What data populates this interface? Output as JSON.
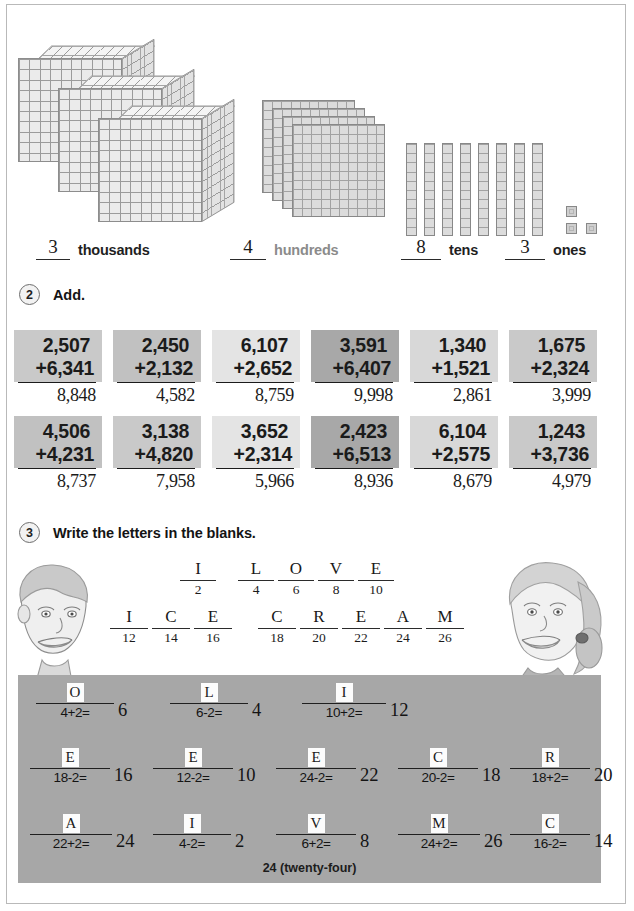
{
  "page": {
    "footer": "24 (twenty-four)",
    "accent_panel_color": "#a7a7a7"
  },
  "place_value": {
    "groups": [
      {
        "value": "3",
        "label": "thousands",
        "style": "dark"
      },
      {
        "value": "4",
        "label": "hundreds",
        "style": "light"
      },
      {
        "value": "8",
        "label": "tens",
        "style": "dark"
      },
      {
        "value": "3",
        "label": "ones",
        "style": "dark"
      }
    ],
    "manipulatives": {
      "thousands_cubes": 3,
      "hundreds_flats": 4,
      "tens_rods": 8,
      "ones_units": 3
    }
  },
  "sections": [
    {
      "number": "2",
      "title": "Add."
    },
    {
      "number": "3",
      "title": "Write the letters in the blanks."
    }
  ],
  "addition": {
    "rows": [
      [
        {
          "top": "2,507",
          "bottom": "+6,341",
          "answer": "8,848",
          "shade": "shade-a"
        },
        {
          "top": "2,450",
          "bottom": "+2,132",
          "answer": "4,582",
          "shade": "shade-b"
        },
        {
          "top": "6,107",
          "bottom": "+2,652",
          "answer": "8,759",
          "shade": "shade-c"
        },
        {
          "top": "3,591",
          "bottom": "+6,407",
          "answer": "9,998",
          "shade": "shade-d"
        },
        {
          "top": "1,340",
          "bottom": "+1,521",
          "answer": "2,861",
          "shade": "shade-e"
        },
        {
          "top": "1,675",
          "bottom": "+2,324",
          "answer": "3,999",
          "shade": "shade-a"
        }
      ],
      [
        {
          "top": "4,506",
          "bottom": "+4,231",
          "answer": "8,737",
          "shade": "shade-b"
        },
        {
          "top": "3,138",
          "bottom": "+4,820",
          "answer": "7,958",
          "shade": "shade-a"
        },
        {
          "top": "3,652",
          "bottom": "+2,314",
          "answer": "5,966",
          "shade": "shade-c"
        },
        {
          "top": "2,423",
          "bottom": "+6,513",
          "answer": "8,936",
          "shade": "shade-d"
        },
        {
          "top": "6,104",
          "bottom": "+2,575",
          "answer": "8,679",
          "shade": "shade-e"
        },
        {
          "top": "1,243",
          "bottom": "+3,736",
          "answer": "4,979",
          "shade": "shade-a"
        }
      ]
    ]
  },
  "code_key": {
    "row1": [
      {
        "letter": "I",
        "number": "2",
        "gap_after": 18
      },
      {
        "letter": "L",
        "number": "4",
        "gap_after": 0
      },
      {
        "letter": "O",
        "number": "6",
        "gap_after": 0
      },
      {
        "letter": "V",
        "number": "8",
        "gap_after": 0
      },
      {
        "letter": "E",
        "number": "10",
        "gap_after": 0
      }
    ],
    "row2": [
      {
        "letter": "I",
        "number": "12",
        "gap_after": 0
      },
      {
        "letter": "C",
        "number": "14",
        "gap_after": 0
      },
      {
        "letter": "E",
        "number": "16",
        "gap_after": 22
      },
      {
        "letter": "C",
        "number": "18",
        "gap_after": 0
      },
      {
        "letter": "R",
        "number": "20",
        "gap_after": 0
      },
      {
        "letter": "E",
        "number": "22",
        "gap_after": 0
      },
      {
        "letter": "A",
        "number": "24",
        "gap_after": 0
      },
      {
        "letter": "M",
        "number": "26",
        "gap_after": 0
      }
    ]
  },
  "answer_panel": {
    "rows": [
      [
        {
          "letter": "O",
          "equation": "4+2=",
          "result": "6"
        },
        {
          "letter": "L",
          "equation": "6-2=",
          "result": "4"
        },
        {
          "letter": "I",
          "equation": "10+2=",
          "result": "12"
        }
      ],
      [
        {
          "letter": "E",
          "equation": "18-2=",
          "result": "16"
        },
        {
          "letter": "E",
          "equation": "12-2=",
          "result": "10"
        },
        {
          "letter": "E",
          "equation": "24-2=",
          "result": "22"
        },
        {
          "letter": "C",
          "equation": "20-2=",
          "result": "18"
        },
        {
          "letter": "R",
          "equation": "18+2=",
          "result": "20"
        }
      ],
      [
        {
          "letter": "A",
          "equation": "22+2=",
          "result": "24"
        },
        {
          "letter": "I",
          "equation": "4-2=",
          "result": "2"
        },
        {
          "letter": "V",
          "equation": "6+2=",
          "result": "8"
        },
        {
          "letter": "M",
          "equation": "24+2=",
          "result": "26"
        },
        {
          "letter": "C",
          "equation": "16-2=",
          "result": "14"
        }
      ]
    ]
  },
  "illustrations": [
    {
      "name": "boy-face",
      "position": "left"
    },
    {
      "name": "girl-face",
      "position": "right"
    },
    {
      "name": "ice-cream-bowl",
      "position": "center-right"
    }
  ]
}
